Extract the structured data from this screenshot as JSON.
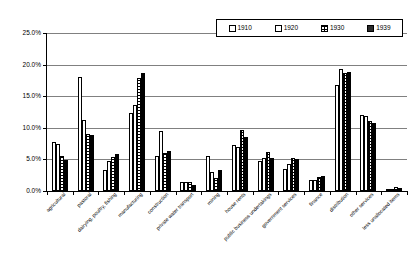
{
  "chart_data": {
    "type": "bar",
    "title": "",
    "subtitle": "",
    "xlabel": "",
    "ylabel": "",
    "ylim": [
      0,
      25
    ],
    "ytick_labels": [
      "0.0%",
      "5.0%",
      "10.0%",
      "15.0%",
      "20.0%",
      "25.0%"
    ],
    "ytick_values": [
      0,
      5,
      10,
      15,
      20,
      25
    ],
    "grid": true,
    "legend_position": "top-right",
    "categories": [
      "agricultural",
      "pastoral",
      "dairying, poultry, fishing",
      "manufacturing",
      "construction",
      "private water transport",
      "mining",
      "house rents",
      "public business undertakings",
      "government services",
      "finance",
      "distribution",
      "other services",
      "less unallocated items"
    ],
    "series": [
      {
        "name": "1910",
        "swatch": "light-outline",
        "values": [
          7.8,
          18.1,
          3.4,
          12.3,
          5.5,
          1.4,
          5.6,
          7.3,
          4.8,
          3.5,
          1.7,
          16.8,
          12.1,
          0.3
        ]
      },
      {
        "name": "1920",
        "swatch": "fine-horizontal-hatch",
        "values": [
          7.5,
          11.3,
          4.8,
          13.6,
          9.5,
          1.4,
          3.0,
          6.9,
          5.3,
          4.2,
          1.8,
          19.3,
          11.8,
          0.3
        ]
      },
      {
        "name": "1930",
        "swatch": "cross-hatch",
        "values": [
          5.5,
          9.0,
          5.4,
          17.9,
          6.0,
          1.4,
          2.0,
          9.7,
          6.2,
          5.3,
          2.2,
          18.7,
          11.1,
          0.6
        ]
      },
      {
        "name": "1939",
        "swatch": "dense-grid",
        "values": [
          4.9,
          8.8,
          5.8,
          18.7,
          6.3,
          0.9,
          3.4,
          8.6,
          5.3,
          5.1,
          2.4,
          18.9,
          10.8,
          0.5
        ]
      }
    ]
  },
  "legend": {
    "entries": [
      {
        "label": "1910"
      },
      {
        "label": "1920"
      },
      {
        "label": "1930"
      },
      {
        "label": "1939"
      }
    ]
  },
  "colors": {
    "axis": "#000000",
    "gridline": "#808080",
    "plot_background": "#ffffff",
    "page_background": "#ffffff"
  }
}
